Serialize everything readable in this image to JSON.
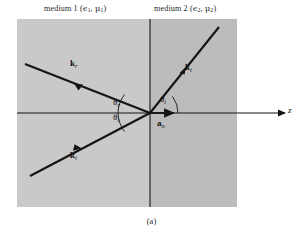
{
  "figure": {
    "caption": "(a)",
    "axis_label": "z",
    "labels": {
      "medium1": "medium 1 (ϵ₁, μ₁)",
      "medium2": "medium 2 (ϵ₂, μ₂)",
      "medium1_parts": {
        "name": "medium 1",
        "eps": "ϵ",
        "eps_sub": "1",
        "mu": "μ",
        "mu_sub": "1"
      },
      "medium2_parts": {
        "name": "medium 2",
        "eps": "ϵ",
        "eps_sub": "2",
        "mu": "μ",
        "mu_sub": "2"
      }
    },
    "vectors": [
      {
        "id": "k-reflected",
        "symbol": "k",
        "subscript": "r",
        "label": "kᵣ"
      },
      {
        "id": "k-transmitted",
        "symbol": "k",
        "subscript": "t",
        "label": "kₜ"
      },
      {
        "id": "k-incident",
        "symbol": "k",
        "subscript": "i",
        "label": "kᵢ"
      },
      {
        "id": "a-normal",
        "symbol": "a",
        "subscript": "n",
        "label": "aₙ"
      }
    ],
    "angles": [
      {
        "id": "theta-reflection",
        "symbol": "θ",
        "subscript": "r",
        "label": "θᵣ"
      },
      {
        "id": "theta-incidence",
        "symbol": "θ",
        "subscript": "i",
        "label": "θᵢ"
      },
      {
        "id": "theta-transmission",
        "symbol": "θ",
        "subscript": "t",
        "label": "θₜ"
      }
    ],
    "colors": {
      "medium1_fill": "#c9c9c9",
      "medium2_fill": "#bcbcbc",
      "line": "#141414",
      "background": "#ffffff"
    }
  }
}
